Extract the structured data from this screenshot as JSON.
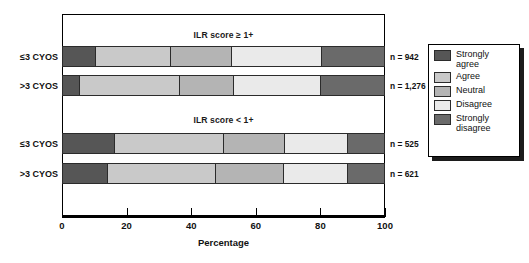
{
  "chart_data": {
    "type": "bar",
    "subtype": "stacked-horizontal-diverging-likert",
    "title": "",
    "xlabel": "Percentage",
    "ylabel": "",
    "xlim": [
      0,
      100
    ],
    "xticks": [
      0,
      20,
      40,
      60,
      80,
      100
    ],
    "xtick_labels": [
      "0",
      "20",
      "40",
      "60",
      "80",
      "100"
    ],
    "grid": false,
    "legend_position": "right-outside",
    "legend_entries": [
      "Strongly\nagree",
      "Agree",
      "Neutral",
      "Disagree",
      "Strongly\ndisagree"
    ],
    "series": [
      {
        "name": "Strongly agree",
        "color": "#565656",
        "values": [
          10.2,
          5.4,
          16.2,
          14.1
        ]
      },
      {
        "name": "Agree",
        "color": "#c9c9c9",
        "values": [
          23.3,
          31.1,
          34.0,
          33.6
        ]
      },
      {
        "name": "Neutral",
        "color": "#b4b4b4",
        "values": [
          19.2,
          16.7,
          19.1,
          21.3
        ]
      },
      {
        "name": "Disagree",
        "color": "#eaeaea",
        "values": [
          27.9,
          27.3,
          19.6,
          19.9
        ]
      },
      {
        "name": "Strongly disagree",
        "color": "#6a6a6a",
        "values": [
          19.4,
          19.5,
          11.1,
          11.1
        ]
      }
    ],
    "groups": [
      {
        "title": "ILR score ≥ 1+",
        "bars": [
          {
            "category": "≤3 CYOS",
            "n_label": "n = 942",
            "values": [
              10.2,
              23.3,
              19.2,
              27.9,
              19.4
            ]
          },
          {
            "category": ">3 CYOS",
            "n_label": "n = 1,276",
            "values": [
              5.4,
              31.1,
              16.7,
              27.3,
              19.5
            ]
          }
        ]
      },
      {
        "title": "ILR score < 1+",
        "bars": [
          {
            "category": "≤3 CYOS",
            "n_label": "n = 525",
            "values": [
              16.2,
              34.0,
              19.1,
              19.6,
              11.1
            ]
          },
          {
            "category": ">3 CYOS",
            "n_label": "n = 621",
            "values": [
              14.1,
              33.6,
              21.3,
              19.9,
              11.1
            ]
          }
        ]
      }
    ]
  },
  "axis": {
    "ticks": [
      {
        "value": 0,
        "label": "0"
      },
      {
        "value": 20,
        "label": "20"
      },
      {
        "value": 40,
        "label": "40"
      },
      {
        "value": 60,
        "label": "60"
      },
      {
        "value": 80,
        "label": "80"
      },
      {
        "value": 100,
        "label": "100"
      }
    ],
    "title": "Percentage"
  },
  "groups": [
    {
      "title": "ILR score ≥ 1+"
    },
    {
      "title": "ILR score < 1+"
    }
  ],
  "bars": [
    {
      "category": "≤3 CYOS",
      "n_label": "n = 942"
    },
    {
      "category": ">3 CYOS",
      "n_label": "n = 1,276"
    },
    {
      "category": "≤3 CYOS",
      "n_label": "n = 525"
    },
    {
      "category": ">3 CYOS",
      "n_label": "n = 621"
    }
  ],
  "legend": {
    "items": [
      {
        "label": "Strongly\nagree",
        "color": "#565656"
      },
      {
        "label": "Agree",
        "color": "#c9c9c9"
      },
      {
        "label": "Neutral",
        "color": "#b4b4b4"
      },
      {
        "label": "Disagree",
        "color": "#eaeaea"
      },
      {
        "label": "Strongly\ndisagree",
        "color": "#6a6a6a"
      }
    ]
  }
}
